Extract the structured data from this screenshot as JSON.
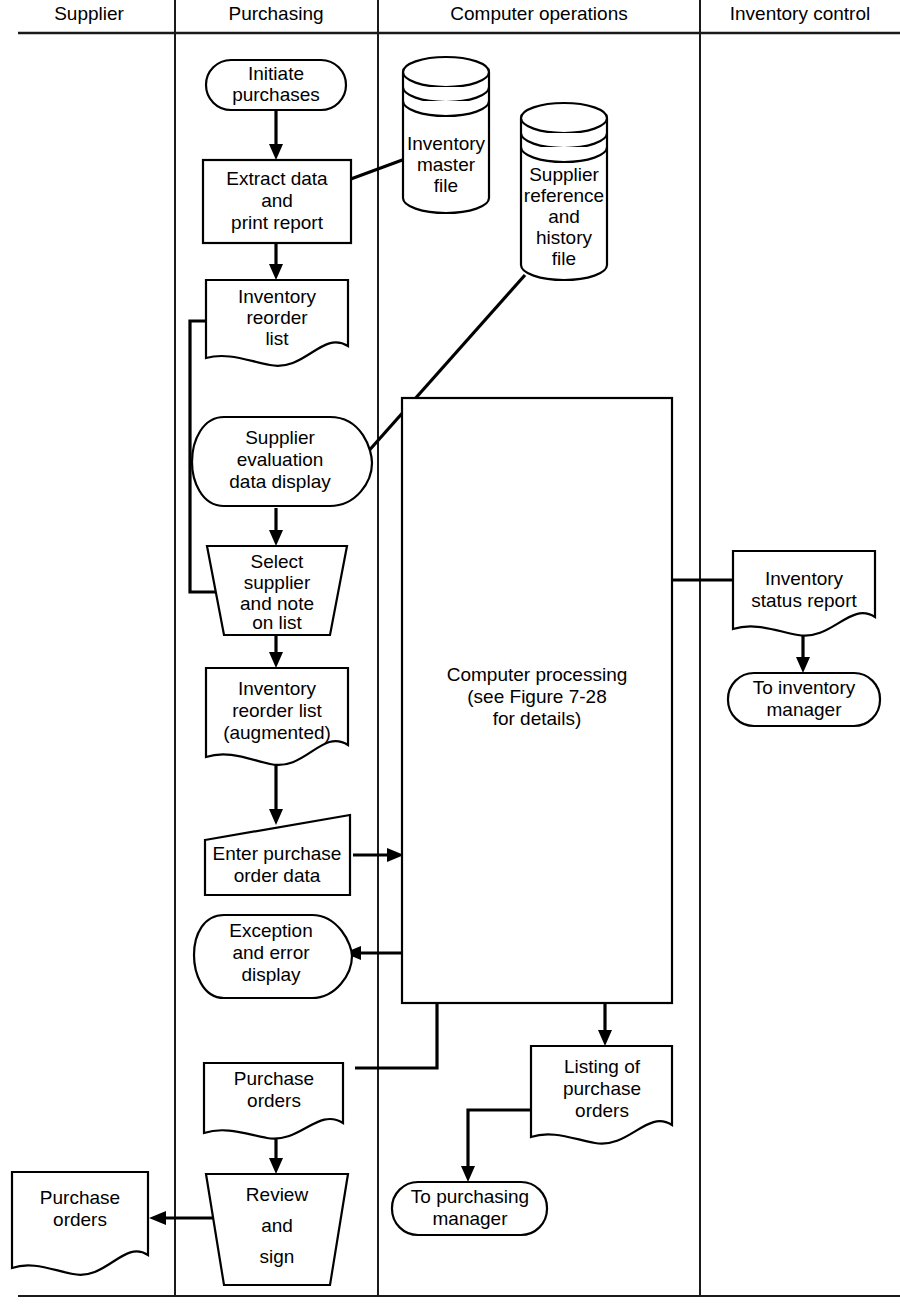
{
  "diagram": {
    "lanes": [
      {
        "id": "supplier",
        "label": "Supplier"
      },
      {
        "id": "purchasing",
        "label": "Purchasing"
      },
      {
        "id": "computer_operations",
        "label": "Computer operations"
      },
      {
        "id": "inventory_control",
        "label": "Inventory control"
      }
    ],
    "nodes": {
      "initiate_purchases": {
        "shape": "terminator",
        "lane": "purchasing",
        "lines": [
          "Initiate",
          "purchases"
        ]
      },
      "extract_data": {
        "shape": "process",
        "lane": "purchasing",
        "lines": [
          "Extract data",
          "and",
          "print report"
        ]
      },
      "inventory_reorder_list": {
        "shape": "document",
        "lane": "purchasing",
        "lines": [
          "Inventory",
          "reorder",
          "list"
        ]
      },
      "supplier_evaluation_display": {
        "shape": "display",
        "lane": "purchasing",
        "lines": [
          "Supplier",
          "evaluation",
          "data display"
        ]
      },
      "select_supplier": {
        "shape": "manual-operation",
        "lane": "purchasing",
        "lines": [
          "Select",
          "supplier",
          "and note",
          "on list"
        ]
      },
      "inventory_reorder_list_augmented": {
        "shape": "document",
        "lane": "purchasing",
        "lines": [
          "Inventory",
          "reorder list",
          "(augmented)"
        ]
      },
      "enter_purchase_order_data": {
        "shape": "manual-input",
        "lane": "purchasing",
        "lines": [
          "Enter purchase",
          "order data"
        ]
      },
      "exception_error_display": {
        "shape": "display",
        "lane": "purchasing",
        "lines": [
          "Exception",
          "and error",
          "display"
        ]
      },
      "purchase_orders_internal": {
        "shape": "document",
        "lane": "purchasing",
        "lines": [
          "Purchase",
          "orders"
        ]
      },
      "review_and_sign": {
        "shape": "manual-operation",
        "lane": "purchasing",
        "lines": [
          "Review",
          "and",
          "sign"
        ]
      },
      "purchase_orders_supplier": {
        "shape": "document",
        "lane": "supplier",
        "lines": [
          "Purchase",
          "orders"
        ]
      },
      "inventory_master_file": {
        "shape": "cylinder",
        "lane": "computer_operations",
        "lines": [
          "Inventory",
          "master",
          "file"
        ]
      },
      "supplier_reference_file": {
        "shape": "cylinder",
        "lane": "computer_operations",
        "lines": [
          "Supplier",
          "reference",
          "and",
          "history",
          "file"
        ]
      },
      "computer_processing": {
        "shape": "process",
        "lane": "computer_operations",
        "lines": [
          "Computer processing",
          "(see Figure  7-28",
          "for details)"
        ]
      },
      "listing_of_purchase_orders": {
        "shape": "document",
        "lane": "computer_operations",
        "lines": [
          "Listing of",
          "purchase",
          "orders"
        ]
      },
      "to_purchasing_manager": {
        "shape": "terminator",
        "lane": "computer_operations",
        "lines": [
          "To purchasing",
          "manager"
        ]
      },
      "inventory_status_report": {
        "shape": "document",
        "lane": "inventory_control",
        "lines": [
          "Inventory",
          "status report"
        ]
      },
      "to_inventory_manager": {
        "shape": "terminator",
        "lane": "inventory_control",
        "lines": [
          "To inventory",
          "manager"
        ]
      }
    },
    "colors": {
      "stroke": "#000000",
      "background": "#ffffff",
      "lane_divider": "#1a1a1a"
    }
  }
}
